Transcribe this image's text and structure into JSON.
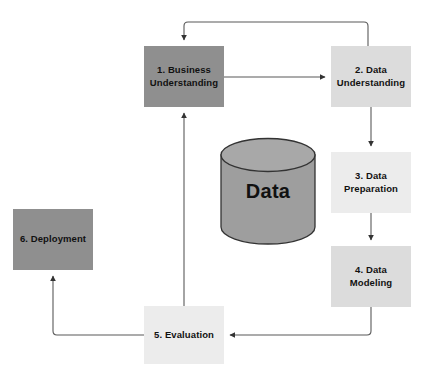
{
  "diagram": {
    "background_color": "#ffffff",
    "connector_color": "#595959",
    "nodes": [
      {
        "id": "business-understanding",
        "label_line1": "1. Business",
        "label_line2": "Understanding",
        "color": "#8f8f8f"
      },
      {
        "id": "data-understanding",
        "label_line1": "2. Data",
        "label_line2": "Understanding",
        "color": "#dcdcdc"
      },
      {
        "id": "data-preparation",
        "label_line1": "3. Data",
        "label_line2": "Preparation",
        "color": "#ececec"
      },
      {
        "id": "data-modeling",
        "label_line1": "4. Data Modeling",
        "label_line2": "",
        "color": "#dcdcdc"
      },
      {
        "id": "evaluation",
        "label_line1": "5. Evaluation",
        "label_line2": "",
        "color": "#ececec"
      },
      {
        "id": "deployment",
        "label_line1": "6. Deployment",
        "label_line2": "",
        "color": "#8f8f8f"
      }
    ],
    "data_store": {
      "label": "Data",
      "fill_color": "#9e9e9e",
      "stroke_color": "#333333"
    },
    "edges": [
      {
        "id": "edge-1-to-2",
        "from": "business-understanding",
        "to": "data-understanding",
        "direction": "right"
      },
      {
        "id": "edge-2-to-1-feedback",
        "from": "data-understanding",
        "to": "business-understanding",
        "direction": "up-over-down"
      },
      {
        "id": "edge-2-to-3",
        "from": "data-understanding",
        "to": "data-preparation",
        "direction": "down"
      },
      {
        "id": "edge-3-to-4",
        "from": "data-preparation",
        "to": "data-modeling",
        "direction": "down"
      },
      {
        "id": "edge-4-to-5",
        "from": "data-modeling",
        "to": "evaluation",
        "direction": "down-left"
      },
      {
        "id": "edge-5-to-1",
        "from": "evaluation",
        "to": "business-understanding",
        "direction": "up"
      },
      {
        "id": "edge-5-to-6",
        "from": "evaluation",
        "to": "deployment",
        "direction": "left-up"
      }
    ]
  }
}
